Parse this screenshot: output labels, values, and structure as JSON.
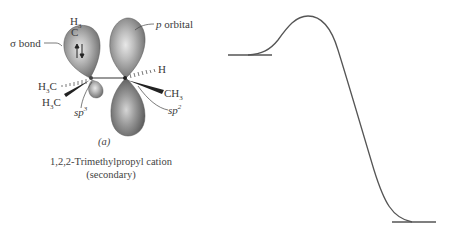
{
  "figure": {
    "panel_label": "(a)",
    "caption_line1": "1,2,2-Trimethylpropyl cation",
    "caption_line2": "(secondary)"
  },
  "molecule": {
    "labels": {
      "sigma_bond": "σ bond",
      "p_orbital_prefix": "p",
      "p_orbital_suffix": " orbital",
      "top_methyl_h": "H",
      "top_methyl_h_sub": "3",
      "top_methyl_c": "C",
      "left_methyl1_h": "H",
      "left_methyl1_sub": "3",
      "left_methyl1_c": "C",
      "left_methyl2_h": "H",
      "left_methyl2_sub": "3",
      "left_methyl2_c": "C",
      "right_h": "H",
      "right_methyl_c": "CH",
      "right_methyl_sub": "3",
      "sp3_base": "sp",
      "sp3_sup": "3",
      "sp2_base": "sp",
      "sp2_sup": "2"
    },
    "electron_pair": "↑↓"
  },
  "energy_diagram": {
    "reactant_level": {
      "x1": 228,
      "x2": 272,
      "y": 55
    },
    "peak": {
      "x": 308,
      "y": 16
    },
    "product_level": {
      "x1": 392,
      "x2": 436,
      "y": 222
    },
    "line_color": "#555555"
  }
}
